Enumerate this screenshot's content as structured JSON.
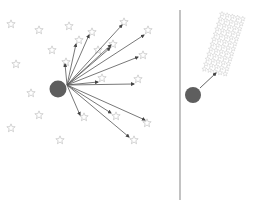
{
  "colors": {
    "background": "#ffffff",
    "star_stroke": "#c4c4c4",
    "arrow": "#555555",
    "circle": "#5e5e5e",
    "divider": "#9a9a9a"
  },
  "left_panel": {
    "circle": {
      "cx": 58,
      "cy": 89,
      "r": 8.5
    },
    "origin": {
      "x": 67,
      "y": 85
    },
    "stars": [
      [
        11,
        24
      ],
      [
        39,
        30
      ],
      [
        69,
        26
      ],
      [
        52,
        50
      ],
      [
        16,
        64
      ],
      [
        66,
        62
      ],
      [
        79,
        40
      ],
      [
        92,
        32
      ],
      [
        113,
        44
      ],
      [
        124,
        22
      ],
      [
        148,
        30
      ],
      [
        143,
        55
      ],
      [
        98,
        50
      ],
      [
        102,
        78
      ],
      [
        138,
        79
      ],
      [
        31,
        93
      ],
      [
        39,
        115
      ],
      [
        11,
        128
      ],
      [
        60,
        140
      ],
      [
        84,
        117
      ],
      [
        116,
        116
      ],
      [
        147,
        123
      ],
      [
        134,
        140
      ]
    ],
    "arrow_targets": [
      [
        65,
        64
      ],
      [
        76,
        44
      ],
      [
        89,
        35
      ],
      [
        122,
        25
      ],
      [
        110,
        48
      ],
      [
        111,
        45
      ],
      [
        144,
        35
      ],
      [
        138,
        57
      ],
      [
        98,
        82
      ],
      [
        134,
        84
      ],
      [
        80,
        115
      ],
      [
        111,
        113
      ],
      [
        145,
        120
      ],
      [
        129,
        137
      ]
    ]
  },
  "divider": {
    "x": 180,
    "y1": 10,
    "y2": 200
  },
  "right_panel": {
    "circle": {
      "cx": 193,
      "cy": 95,
      "r": 8
    },
    "arrow": {
      "x1": 200,
      "y1": 88,
      "x2": 216,
      "y2": 73
    },
    "cluster": {
      "rows": 12,
      "cols": 5,
      "origin": {
        "x": 222,
        "y": 14
      },
      "dx": 5.2,
      "dy": 5,
      "skew": -1.6
    }
  }
}
